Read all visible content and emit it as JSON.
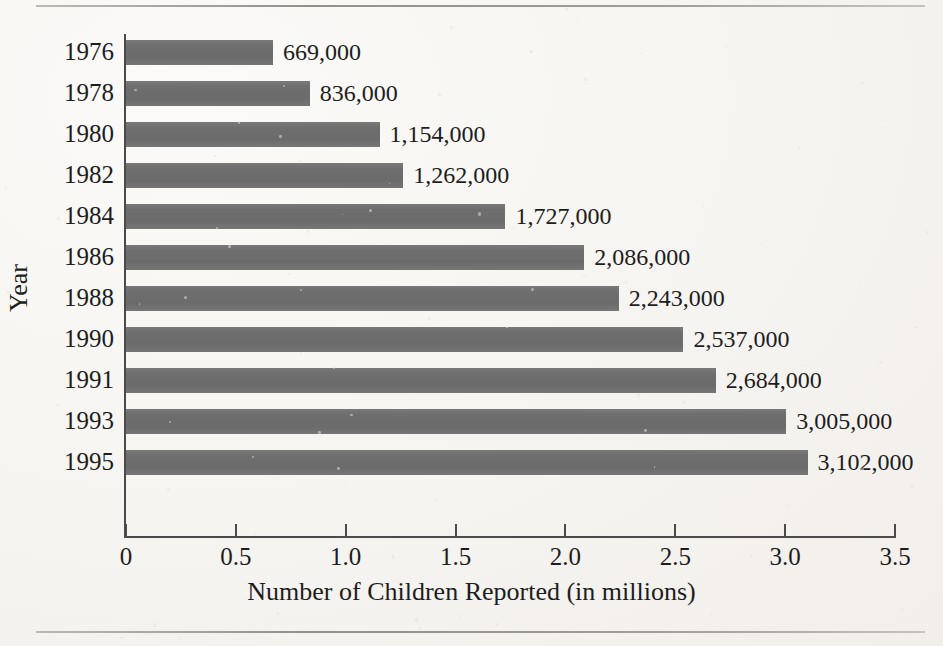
{
  "figure": {
    "has_top_rule": true,
    "has_bottom_rule": true,
    "background_color": "#f8f6f3",
    "bar_color": "#6f6f6f",
    "axis_color": "#4a4a4a",
    "text_color": "#1d1d1d"
  },
  "chart_data": {
    "type": "bar",
    "orientation": "horizontal",
    "title": "",
    "xlabel": "Number of Children Reported (in millions)",
    "ylabel": "Year",
    "categories": [
      "1976",
      "1978",
      "1980",
      "1982",
      "1984",
      "1986",
      "1988",
      "1990",
      "1991",
      "1993",
      "1995"
    ],
    "values": [
      0.669,
      0.836,
      1.154,
      1.262,
      1.727,
      2.086,
      2.243,
      2.537,
      2.684,
      3.005,
      3.102
    ],
    "data_labels": [
      "669,000",
      "836,000",
      "1,154,000",
      "1,262,000",
      "1,727,000",
      "2,086,000",
      "2,243,000",
      "2,537,000",
      "2,684,000",
      "3,005,000",
      "3,102,000"
    ],
    "xlim": [
      0,
      3.5
    ],
    "xticks": [
      0,
      0.5,
      1.0,
      1.5,
      2.0,
      2.5,
      3.0,
      3.5
    ],
    "xtick_labels": [
      "0",
      "0.5",
      "1.0",
      "1.5",
      "2.0",
      "2.5",
      "3.0",
      "3.5"
    ],
    "grid": false,
    "legend": false,
    "series": [
      {
        "name": "Number of Children Reported",
        "values": [
          0.669,
          0.836,
          1.154,
          1.262,
          1.727,
          2.086,
          2.243,
          2.537,
          2.684,
          3.005,
          3.102
        ]
      }
    ]
  }
}
